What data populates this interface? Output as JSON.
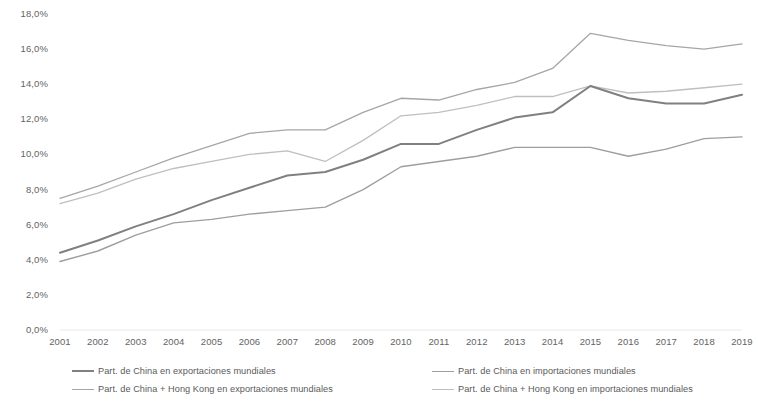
{
  "chart_data": {
    "type": "line",
    "title": "",
    "subtitle": "",
    "xlabel": "",
    "ylabel": "",
    "grid": false,
    "legend_position": "bottom",
    "categories": [
      "2001",
      "2002",
      "2003",
      "2004",
      "2005",
      "2006",
      "2007",
      "2008",
      "2009",
      "2010",
      "2011",
      "2012",
      "2013",
      "2014",
      "2015",
      "2016",
      "2017",
      "2018",
      "2019"
    ],
    "x": [
      2001,
      2002,
      2003,
      2004,
      2005,
      2006,
      2007,
      2008,
      2009,
      2010,
      2011,
      2012,
      2013,
      2014,
      2015,
      2016,
      2017,
      2018,
      2019
    ],
    "xlim": [
      2001,
      2019
    ],
    "ylim": [
      0.0,
      18.0
    ],
    "ytick_values": [
      0.0,
      2.0,
      4.0,
      6.0,
      8.0,
      10.0,
      12.0,
      14.0,
      16.0,
      18.0
    ],
    "ytick_labels": [
      "0,0%",
      "2,0%",
      "4,0%",
      "6,0%",
      "8,0%",
      "10,0%",
      "12,0%",
      "14,0%",
      "16,0%",
      "18,0%"
    ],
    "unit": "%",
    "decimal_separator": ",",
    "series": [
      {
        "name": "Part. de China en exportaciones mundiales",
        "color": "#808080",
        "width": 2.0,
        "values": [
          4.4,
          5.1,
          5.9,
          6.6,
          7.4,
          8.1,
          8.8,
          9.0,
          9.7,
          10.6,
          10.6,
          11.4,
          12.1,
          12.4,
          13.9,
          13.2,
          12.9,
          12.9,
          13.4
        ]
      },
      {
        "name": "Part. de China en importaciones mundiales",
        "color": "#9e9e9e",
        "width": 1.4,
        "values": [
          3.9,
          4.5,
          5.4,
          6.1,
          6.3,
          6.6,
          6.8,
          7.0,
          8.0,
          9.3,
          9.6,
          9.9,
          10.4,
          10.4,
          10.4,
          9.9,
          10.3,
          10.9,
          11.0
        ]
      },
      {
        "name": "Part. de China + Hong Kong en exportaciones mundiales",
        "color": "#a6a6a6",
        "width": 1.3,
        "values": [
          7.5,
          8.2,
          9.0,
          9.8,
          10.5,
          11.2,
          11.4,
          11.4,
          12.4,
          13.2,
          13.1,
          13.7,
          14.1,
          14.9,
          16.9,
          16.5,
          16.2,
          16.0,
          16.3
        ]
      },
      {
        "name": "Part. de China + Hong Kong en importaciones mundiales",
        "color": "#bfbfbf",
        "width": 1.3,
        "values": [
          7.2,
          7.8,
          8.6,
          9.2,
          9.6,
          10.0,
          10.2,
          9.6,
          10.8,
          12.2,
          12.4,
          12.8,
          13.3,
          13.3,
          13.9,
          13.5,
          13.6,
          13.8,
          14.0
        ]
      }
    ],
    "legend_entries": [
      {
        "label": "Part. de China en exportaciones mundiales",
        "color": "#808080",
        "width": 2.0
      },
      {
        "label": "Part. de China en importaciones mundiales",
        "color": "#9e9e9e",
        "width": 1.6
      },
      {
        "label": "Part. de China + Hong Kong en exportaciones mundiales",
        "color": "#a6a6a6",
        "width": 1.2
      },
      {
        "label": "Part. de China + Hong Kong en importaciones mundiales",
        "color": "#bfbfbf",
        "width": 1.2
      }
    ]
  }
}
